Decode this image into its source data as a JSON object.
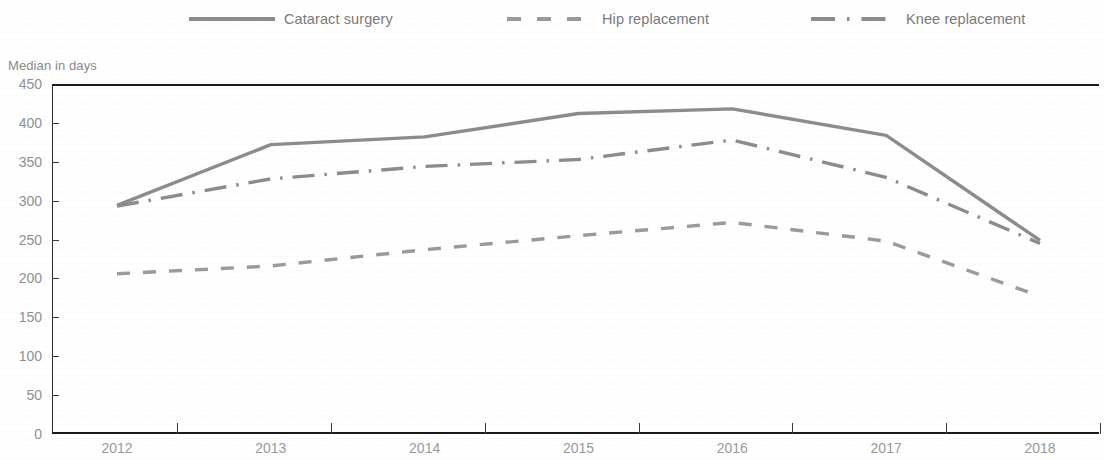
{
  "legend": {
    "items": [
      {
        "label": "Cataract surgery",
        "key": "solid-line-key",
        "style": "solid",
        "color": "#8c8c8c",
        "x": 189
      },
      {
        "label": "Hip replacement",
        "key": "dashed-line-key",
        "style": "dashed",
        "color": "#9a9a9a",
        "x": 507
      },
      {
        "label": "Knee replacement",
        "key": "dash-dot-line-key",
        "style": "dash-dot",
        "color": "#8c8c8c",
        "x": 811
      }
    ]
  },
  "axis_title": "Median in days",
  "chart_data": {
    "type": "line",
    "title": "",
    "subtitle": "",
    "xlabel": "",
    "ylabel": "Median in days",
    "categories": [
      "2012",
      "2013",
      "2014",
      "2015",
      "2016",
      "2017",
      "2018"
    ],
    "x": [
      2012,
      2013,
      2014,
      2015,
      2016,
      2017,
      2018
    ],
    "ylim": [
      0,
      450
    ],
    "yticks": [
      0,
      50,
      100,
      150,
      200,
      250,
      300,
      350,
      400,
      450
    ],
    "grid": false,
    "legend_position": "top",
    "series": [
      {
        "name": "Cataract surgery",
        "style": "solid",
        "color": "#8c8c8c",
        "values": [
          294,
          372,
          382,
          412,
          418,
          384,
          249
        ]
      },
      {
        "name": "Hip replacement",
        "style": "dashed",
        "color": "#9a9a9a",
        "values": [
          206,
          216,
          237,
          255,
          272,
          248,
          177
        ]
      },
      {
        "name": "Knee replacement",
        "style": "dash-dot",
        "color": "#8c8c8c",
        "values": [
          293,
          328,
          344,
          353,
          378,
          330,
          245
        ]
      }
    ]
  }
}
